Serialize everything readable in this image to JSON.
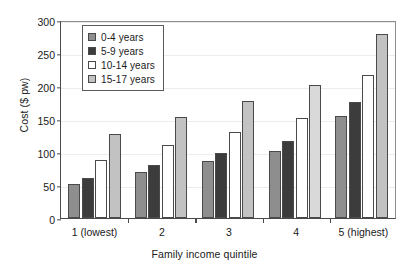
{
  "chart_data": {
    "type": "bar",
    "title": "",
    "xlabel": "Family income quintile",
    "ylabel": "Cost ($ pw)",
    "categories": [
      "1 (lowest)",
      "2",
      "3",
      "4",
      "5 (highest)"
    ],
    "ylim": [
      0,
      300
    ],
    "yticks": [
      0,
      50,
      100,
      150,
      200,
      250,
      300
    ],
    "ytick_labels": [
      "0",
      "50",
      "100",
      "150",
      "200",
      "250",
      "300"
    ],
    "grid": true,
    "legend_position": "upper left",
    "series": [
      {
        "name": "0-4 years",
        "color": "#8e8e8e",
        "values": [
          52,
          70,
          86,
          102,
          155
        ]
      },
      {
        "name": "5-9 years",
        "color": "#3c3c3c",
        "values": [
          60,
          81,
          99,
          117,
          176
        ]
      },
      {
        "name": "10-14 years",
        "color": "#ffffff",
        "values": [
          88,
          110,
          131,
          152,
          217
        ]
      },
      {
        "name": "15-17 years",
        "color": "#c2c2c2",
        "values": [
          127,
          153,
          177,
          202,
          279
        ]
      }
    ]
  }
}
